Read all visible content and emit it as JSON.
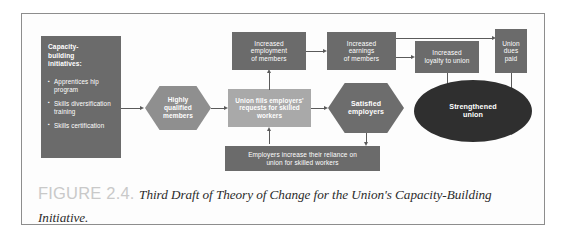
{
  "figure": {
    "caption_label": "FIGURE 2.4.",
    "caption_text": "Third Draft of Theory of Change for the Union's Capacity-Building Initiative."
  },
  "colors": {
    "node_dark_gray": "#6b6b6b",
    "node_light_gray": "#a9a9a9",
    "hexagon_gray": "#8f8f8f",
    "ellipse_black": "#2f2f2f",
    "arrow_gray": "#5a5a5a",
    "frame_border": "#8d8d8d",
    "caption_label_gray": "#c9c9c9",
    "page_background": "#ffffff"
  },
  "diagram": {
    "capacity_box": {
      "heading": "Capacity-\nbuilding\ninitiatives:",
      "bullets": [
        "Apprentices hip\n  program",
        "Skills\n  diversification\n  training",
        "Skills certification"
      ]
    },
    "nodes": [
      {
        "id": "highly-qualified-members",
        "label": "Highly\nqualified\nmembers",
        "shape": "hexagon"
      },
      {
        "id": "union-fills-requests",
        "label": "Union fills employers'\nrequests for skilled\nworkers",
        "shape": "rectangle"
      },
      {
        "id": "satisfied-employers",
        "label": "Satisfied\nemployers",
        "shape": "hexagon"
      },
      {
        "id": "increased-employment",
        "label": "Increased\nemployment\nof members",
        "shape": "rectangle"
      },
      {
        "id": "increased-earnings",
        "label": "Increased\nearnings\nof members",
        "shape": "rectangle"
      },
      {
        "id": "increased-loyalty",
        "label": "Increased\nloyalty to union",
        "shape": "rectangle"
      },
      {
        "id": "union-dues-paid",
        "label": "Union\ndues\npaid",
        "shape": "rectangle"
      },
      {
        "id": "strengthened-union",
        "label": "Strengthened\nunion",
        "shape": "ellipse"
      },
      {
        "id": "employers-reliance",
        "label": "Employers increase their reliance on\nunion for skilled workers",
        "shape": "rectangle"
      }
    ]
  }
}
